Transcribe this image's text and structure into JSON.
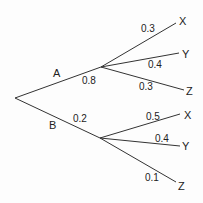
{
  "diagram": {
    "type": "probability-tree",
    "root": {
      "branches": [
        {
          "label": "A",
          "probability": "0.8",
          "branches": [
            {
              "label": "X",
              "probability": "0.3"
            },
            {
              "label": "Y",
              "probability": "0.4"
            },
            {
              "label": "Z",
              "probability": "0.3"
            }
          ]
        },
        {
          "label": "B",
          "probability": "0.2",
          "branches": [
            {
              "label": "X",
              "probability": "0.5"
            },
            {
              "label": "Y",
              "probability": "0.4"
            },
            {
              "label": "Z",
              "probability": "0.1"
            }
          ]
        }
      ]
    },
    "line_color": "#333333"
  }
}
